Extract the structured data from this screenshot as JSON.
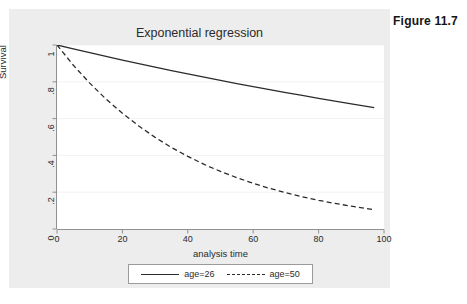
{
  "figure": {
    "caption": "Figure 11.7"
  },
  "chart_data": {
    "type": "line",
    "title": "Exponential regression",
    "xlabel": "analysis time",
    "ylabel": "Survival",
    "xlim": [
      0,
      100
    ],
    "ylim": [
      0,
      1
    ],
    "xticks": [
      "0",
      "20",
      "40",
      "60",
      "80",
      "100"
    ],
    "xtick_values": [
      0,
      20,
      40,
      60,
      80,
      100
    ],
    "yticks": [
      "0",
      ".2",
      ".4",
      ".6",
      ".8",
      "1"
    ],
    "ytick_values": [
      0,
      0.2,
      0.4,
      0.6,
      0.8,
      1
    ],
    "grid": "horizontal",
    "legend_position": "below",
    "series": [
      {
        "name": "age=26",
        "style": "solid",
        "color": "#2b2b2b",
        "hazard": 0.004276,
        "x": [
          0,
          5,
          10,
          15,
          20,
          25,
          30,
          35,
          40,
          45,
          50,
          55,
          60,
          65,
          70,
          75,
          80,
          85,
          90,
          97
        ],
        "values": [
          1.0,
          0.979,
          0.958,
          0.938,
          0.918,
          0.899,
          0.88,
          0.861,
          0.843,
          0.825,
          0.808,
          0.79,
          0.774,
          0.757,
          0.741,
          0.726,
          0.71,
          0.695,
          0.68,
          0.66
        ]
      },
      {
        "name": "age=50",
        "style": "dashed",
        "color": "#2b2b2b",
        "hazard": 0.023227,
        "x": [
          0,
          5,
          10,
          15,
          20,
          25,
          30,
          35,
          40,
          45,
          50,
          55,
          60,
          65,
          70,
          75,
          80,
          85,
          90,
          97
        ],
        "values": [
          1.0,
          0.89,
          0.793,
          0.706,
          0.629,
          0.56,
          0.498,
          0.443,
          0.395,
          0.351,
          0.313,
          0.279,
          0.248,
          0.221,
          0.197,
          0.175,
          0.156,
          0.139,
          0.124,
          0.105
        ]
      }
    ]
  },
  "legend": {
    "entries": [
      {
        "label": "age=26",
        "style": "solid"
      },
      {
        "label": "age=50",
        "style": "dashed"
      }
    ]
  },
  "colors": {
    "graph_region": "#ededed",
    "plot_region": "#ffffff",
    "axis": "#919191",
    "grid": "#f2f2f2",
    "line": "#2b2b2b",
    "text": "#2b2b2b"
  }
}
